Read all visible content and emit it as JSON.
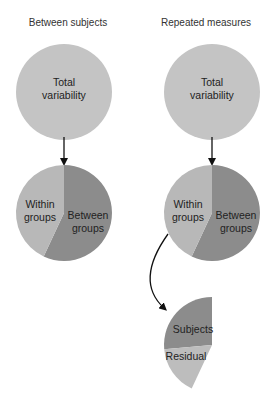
{
  "columns": [
    {
      "title": "Between subjects",
      "total": {
        "line1": "Total",
        "line2": "variability"
      },
      "pie": {
        "within": {
          "line1": "Within",
          "line2": "groups"
        },
        "between": {
          "line1": "Between",
          "line2": "groups"
        }
      }
    },
    {
      "title": "Repeated measures",
      "total": {
        "line1": "Total",
        "line2": "variability"
      },
      "pie": {
        "within": {
          "line1": "Within",
          "line2": "groups"
        },
        "between": {
          "line1": "Between",
          "line2": "groups"
        }
      },
      "split": {
        "subjects": "Subjects",
        "residual": "Residual"
      }
    }
  ],
  "colors": {
    "total": "#c4c4c4",
    "within": "#b8b8b8",
    "between": "#8c8c8c",
    "subjects": "#8c8c8c",
    "residual": "#bdbdbd",
    "arrow": "#111111"
  }
}
